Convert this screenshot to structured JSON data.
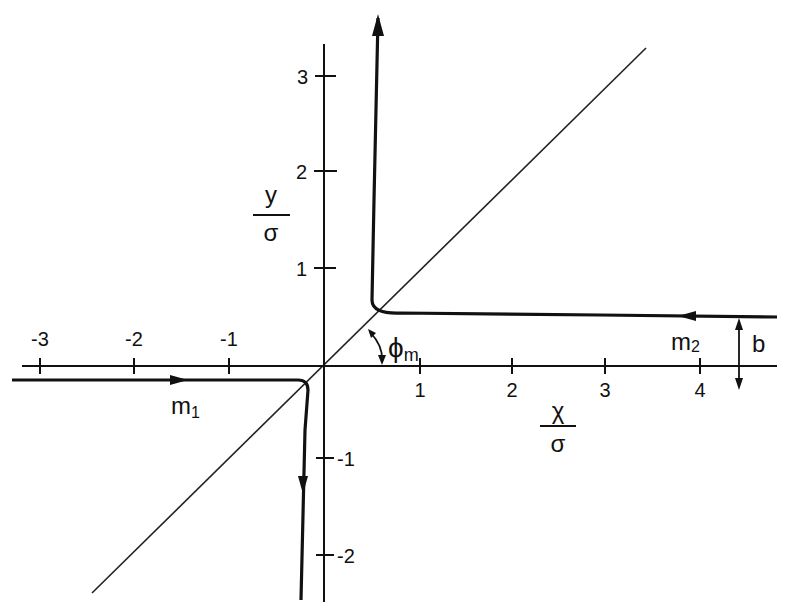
{
  "figure": {
    "type": "trajectory diagram",
    "x_axis": {
      "label_num": "χ",
      "label_den": "σ",
      "ticks": [
        {
          "value": -3,
          "label": "-3"
        },
        {
          "value": -2,
          "label": "-2"
        },
        {
          "value": -1,
          "label": "-1"
        },
        {
          "value": 1,
          "label": "1"
        },
        {
          "value": 2,
          "label": "2"
        },
        {
          "value": 3,
          "label": "3"
        },
        {
          "value": 4,
          "label": "4"
        }
      ]
    },
    "y_axis": {
      "label_num": "y",
      "label_den": "σ",
      "ticks": [
        {
          "value": 3,
          "label": "3"
        },
        {
          "value": 2,
          "label": "2"
        },
        {
          "value": 1,
          "label": "1"
        },
        {
          "value": -1,
          "label": "-1"
        },
        {
          "value": -2,
          "label": "-2"
        }
      ]
    },
    "labels": {
      "m1": "m",
      "m1_sub": "1",
      "m2": "m",
      "m2_sub": "2",
      "b": "b",
      "phi": "ϕ",
      "phi_sub": "m"
    },
    "diagonal": "line y = x through origin",
    "trajectories": [
      {
        "name": "m1",
        "description": "enters from left along y ≈ -0.15, turns downward near x ≈ -0.2, exits downward"
      },
      {
        "name": "m2",
        "description": "enters from right along y ≈ b ≈ 0.5, turns upward near x ≈ 0.5, exits upward"
      }
    ]
  }
}
